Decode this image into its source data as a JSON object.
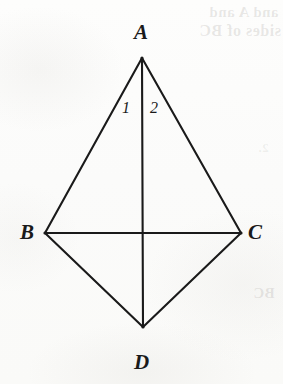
{
  "figure": {
    "kind": "geometry-diagram",
    "shape_name": "quadrilateral ABDC (kite)",
    "background_color": "#fcfcfb",
    "stroke_color": "#1a1a1a",
    "vertices": [
      {
        "id": "A",
        "label": "A",
        "x": 142,
        "y": 58,
        "label_x": 134,
        "label_y": 22
      },
      {
        "id": "B",
        "label": "B",
        "x": 45,
        "y": 233,
        "label_x": 20,
        "label_y": 222
      },
      {
        "id": "C",
        "label": "C",
        "x": 241,
        "y": 233,
        "label_x": 248,
        "label_y": 222
      },
      {
        "id": "D",
        "label": "D",
        "x": 143,
        "y": 327,
        "label_x": 134,
        "label_y": 352
      }
    ],
    "edges": [
      {
        "id": "AB",
        "from": "A",
        "to": "B",
        "kind": "side"
      },
      {
        "id": "AC",
        "from": "A",
        "to": "C",
        "kind": "side"
      },
      {
        "id": "BD",
        "from": "B",
        "to": "D",
        "kind": "side"
      },
      {
        "id": "CD",
        "from": "C",
        "to": "D",
        "kind": "side"
      },
      {
        "id": "AD",
        "from": "A",
        "to": "D",
        "kind": "diagonal"
      },
      {
        "id": "BC",
        "from": "B",
        "to": "C",
        "kind": "diagonal"
      }
    ],
    "angle_labels": [
      {
        "id": "angle-1",
        "label": "1",
        "x": 122,
        "y": 100,
        "at_vertex": "A",
        "between": [
          "AB",
          "AD"
        ]
      },
      {
        "id": "angle-2",
        "label": "2",
        "x": 150,
        "y": 100,
        "at_vertex": "A",
        "between": [
          "AD",
          "AC"
        ]
      }
    ]
  },
  "bleed_through": {
    "note": "faint mirrored show-through text from the reverse of the scanned page",
    "line_1": "and A and",
    "line_2": "sides of BC",
    "line_3": "BC",
    "line_4": "2."
  }
}
